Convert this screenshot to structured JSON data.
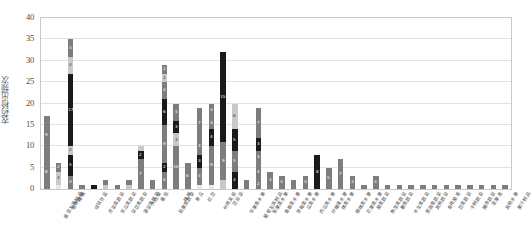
{
  "chart_data": {
    "type": "bar",
    "subtype": "stacked-bar",
    "title": "",
    "xlabel": "",
    "ylabel": "农药检出频次",
    "ylim": [
      0,
      40
    ],
    "yticks": [
      0,
      5,
      10,
      15,
      20,
      25,
      30,
      35,
      40
    ],
    "grid": true,
    "legend": "none",
    "colors": {
      "dark": "#1a1a1a",
      "mid": "#7d7d7d",
      "light": "#c9c9c9",
      "pale": "#e8e8e8",
      "gridline": "#e2e2e2",
      "frame": "#c8c8c8",
      "text": "#4a4a4a"
    },
    "categories": [
      "韭菜及其制品",
      "普通白菜",
      "柑桔",
      "结球甘蓝",
      "芹菜类蔬菜",
      "苦瓜类蔬菜",
      "菜豆类蔬菜",
      "菠菜类蔬菜",
      "大白菜",
      "番茄",
      "茄果类蔬菜",
      "辣椒",
      "黄瓜",
      "豇豆",
      "叶用莴苣",
      "豆芽菜",
      "苹果类水果",
      "葡萄及其制品",
      "梨果类水果",
      "香蕉类水果",
      "草莓类水果",
      "瓜类水果",
      "西瓜类水果",
      "柠檬类水果",
      "桃类水果",
      "樱桃类水果",
      "芒果类水果",
      "菌类蔬菜",
      "根茎类蔬菜",
      "薯类蔬菜",
      "水生类蔬菜",
      "葱蒜类蔬菜",
      "其他蔬菜",
      "食用菌类",
      "豆类蔬菜",
      "干制蔬菜",
      "腌渍蔬菜",
      "坚果类",
      "其他水果",
      "果汁制品"
    ],
    "bars": [
      {
        "i": 0,
        "total": 17,
        "segments": [
          {
            "v": 8,
            "c": "mid",
            "label": "8"
          },
          {
            "v": 9,
            "c": "mid",
            "label": "9"
          }
        ]
      },
      {
        "i": 1,
        "total": 6,
        "segments": [
          {
            "v": 1,
            "c": "pale",
            "label": ""
          },
          {
            "v": 3,
            "c": "light",
            "label": "3"
          },
          {
            "v": 2,
            "c": "mid",
            "label": "2"
          }
        ]
      },
      {
        "i": 2,
        "total": 35,
        "segments": [
          {
            "v": 3,
            "c": "mid",
            "label": "3"
          },
          {
            "v": 5,
            "c": "dark",
            "label": "5"
          },
          {
            "v": 2,
            "c": "light",
            "label": "2"
          },
          {
            "v": 17,
            "c": "dark",
            "label": "17"
          },
          {
            "v": 4,
            "c": "light",
            "label": "4"
          },
          {
            "v": 4,
            "c": "mid",
            "label": "4"
          }
        ]
      },
      {
        "i": 3,
        "total": 1,
        "segments": [
          {
            "v": 1,
            "c": "mid",
            "label": ""
          }
        ]
      },
      {
        "i": 4,
        "total": 1,
        "segments": [
          {
            "v": 1,
            "c": "dark",
            "label": ""
          }
        ]
      },
      {
        "i": 5,
        "total": 2,
        "segments": [
          {
            "v": 1,
            "c": "light",
            "label": ""
          },
          {
            "v": 1,
            "c": "mid",
            "label": ""
          }
        ]
      },
      {
        "i": 6,
        "total": 1,
        "segments": [
          {
            "v": 1,
            "c": "mid",
            "label": ""
          }
        ]
      },
      {
        "i": 7,
        "total": 2,
        "segments": [
          {
            "v": 1,
            "c": "light",
            "label": ""
          },
          {
            "v": 1,
            "c": "mid",
            "label": ""
          }
        ]
      },
      {
        "i": 8,
        "total": 10,
        "segments": [
          {
            "v": 7,
            "c": "mid",
            "label": "7"
          },
          {
            "v": 2,
            "c": "dark",
            "label": "2"
          },
          {
            "v": 1,
            "c": "light",
            "label": ""
          }
        ]
      },
      {
        "i": 9,
        "total": 2,
        "segments": [
          {
            "v": 2,
            "c": "mid",
            "label": ""
          }
        ]
      },
      {
        "i": 10,
        "total": 29,
        "segments": [
          {
            "v": 4,
            "c": "mid",
            "label": "4"
          },
          {
            "v": 2,
            "c": "dark",
            "label": "2"
          },
          {
            "v": 9,
            "c": "mid",
            "label": "9"
          },
          {
            "v": 6,
            "c": "dark",
            "label": "6"
          },
          {
            "v": 4,
            "c": "mid",
            "label": "4"
          },
          {
            "v": 2,
            "c": "light",
            "label": "2"
          },
          {
            "v": 2,
            "c": "mid",
            "label": "2"
          }
        ]
      },
      {
        "i": 11,
        "total": 20,
        "segments": [
          {
            "v": 10,
            "c": "mid",
            "label": "10"
          },
          {
            "v": 3,
            "c": "light",
            "label": "3"
          },
          {
            "v": 3,
            "c": "dark",
            "label": "3"
          },
          {
            "v": 4,
            "c": "mid",
            "label": "4"
          }
        ]
      },
      {
        "i": 12,
        "total": 6,
        "segments": [
          {
            "v": 6,
            "c": "mid",
            "label": "6"
          }
        ]
      },
      {
        "i": 13,
        "total": 19,
        "segments": [
          {
            "v": 1,
            "c": "pale",
            "label": ""
          },
          {
            "v": 4,
            "c": "mid",
            "label": "4"
          },
          {
            "v": 3,
            "c": "dark",
            "label": "3"
          },
          {
            "v": 4,
            "c": "mid",
            "label": "4"
          },
          {
            "v": 7,
            "c": "mid",
            "label": "7"
          }
        ]
      },
      {
        "i": 14,
        "total": 20,
        "segments": [
          {
            "v": 1,
            "c": "pale",
            "label": ""
          },
          {
            "v": 9,
            "c": "mid",
            "label": "9"
          },
          {
            "v": 4,
            "c": "dark",
            "label": "4"
          },
          {
            "v": 3,
            "c": "mid",
            "label": "3"
          },
          {
            "v": 3,
            "c": "mid",
            "label": "3"
          }
        ]
      },
      {
        "i": 15,
        "total": 32,
        "segments": [
          {
            "v": 2,
            "c": "light",
            "label": ""
          },
          {
            "v": 9,
            "c": "mid",
            "label": "9"
          },
          {
            "v": 21,
            "c": "dark",
            "label": "15"
          }
        ]
      },
      {
        "i": 16,
        "total": 20,
        "segments": [
          {
            "v": 4,
            "c": "dark",
            "label": "4"
          },
          {
            "v": 5,
            "c": "mid",
            "label": "5"
          },
          {
            "v": 5,
            "c": "dark",
            "label": "5"
          },
          {
            "v": 6,
            "c": "light",
            "label": "6"
          }
        ]
      },
      {
        "i": 17,
        "total": 2,
        "segments": [
          {
            "v": 2,
            "c": "mid",
            "label": ""
          }
        ]
      },
      {
        "i": 18,
        "total": 19,
        "segments": [
          {
            "v": 2,
            "c": "mid",
            "label": "2"
          },
          {
            "v": 4,
            "c": "mid",
            "label": "4"
          },
          {
            "v": 3,
            "c": "mid",
            "label": "3"
          },
          {
            "v": 3,
            "c": "dark",
            "label": "3"
          },
          {
            "v": 7,
            "c": "mid",
            "label": "7"
          }
        ]
      },
      {
        "i": 19,
        "total": 4,
        "segments": [
          {
            "v": 4,
            "c": "mid",
            "label": "4"
          }
        ]
      },
      {
        "i": 20,
        "total": 3,
        "segments": [
          {
            "v": 3,
            "c": "mid",
            "label": "3"
          }
        ]
      },
      {
        "i": 21,
        "total": 2,
        "segments": [
          {
            "v": 2,
            "c": "mid",
            "label": ""
          }
        ]
      },
      {
        "i": 22,
        "total": 3,
        "segments": [
          {
            "v": 3,
            "c": "mid",
            "label": "3"
          }
        ]
      },
      {
        "i": 23,
        "total": 8,
        "segments": [
          {
            "v": 8,
            "c": "dark",
            "label": "8"
          }
        ]
      },
      {
        "i": 24,
        "total": 5,
        "segments": [
          {
            "v": 5,
            "c": "mid",
            "label": "5"
          }
        ]
      },
      {
        "i": 25,
        "total": 7,
        "segments": [
          {
            "v": 7,
            "c": "mid",
            "label": "7"
          }
        ]
      },
      {
        "i": 26,
        "total": 3,
        "segments": [
          {
            "v": 3,
            "c": "mid",
            "label": "3"
          }
        ]
      },
      {
        "i": 27,
        "total": 1,
        "segments": [
          {
            "v": 1,
            "c": "mid",
            "label": ""
          }
        ]
      },
      {
        "i": 28,
        "total": 3,
        "segments": [
          {
            "v": 3,
            "c": "mid",
            "label": "3"
          }
        ]
      },
      {
        "i": 29,
        "total": 1,
        "segments": [
          {
            "v": 1,
            "c": "mid",
            "label": ""
          }
        ]
      },
      {
        "i": 30,
        "total": 1,
        "segments": [
          {
            "v": 1,
            "c": "mid",
            "label": ""
          }
        ]
      },
      {
        "i": 31,
        "total": 1,
        "segments": [
          {
            "v": 1,
            "c": "mid",
            "label": ""
          }
        ]
      },
      {
        "i": 32,
        "total": 1,
        "segments": [
          {
            "v": 1,
            "c": "mid",
            "label": ""
          }
        ]
      },
      {
        "i": 33,
        "total": 1,
        "segments": [
          {
            "v": 1,
            "c": "mid",
            "label": ""
          }
        ]
      },
      {
        "i": 34,
        "total": 1,
        "segments": [
          {
            "v": 1,
            "c": "mid",
            "label": ""
          }
        ]
      },
      {
        "i": 35,
        "total": 1,
        "segments": [
          {
            "v": 1,
            "c": "mid",
            "label": ""
          }
        ]
      },
      {
        "i": 36,
        "total": 1,
        "segments": [
          {
            "v": 1,
            "c": "mid",
            "label": ""
          }
        ]
      },
      {
        "i": 37,
        "total": 1,
        "segments": [
          {
            "v": 1,
            "c": "mid",
            "label": ""
          }
        ]
      },
      {
        "i": 38,
        "total": 1,
        "segments": [
          {
            "v": 1,
            "c": "mid",
            "label": ""
          }
        ]
      },
      {
        "i": 39,
        "total": 1,
        "segments": [
          {
            "v": 1,
            "c": "mid",
            "label": ""
          }
        ]
      }
    ]
  }
}
